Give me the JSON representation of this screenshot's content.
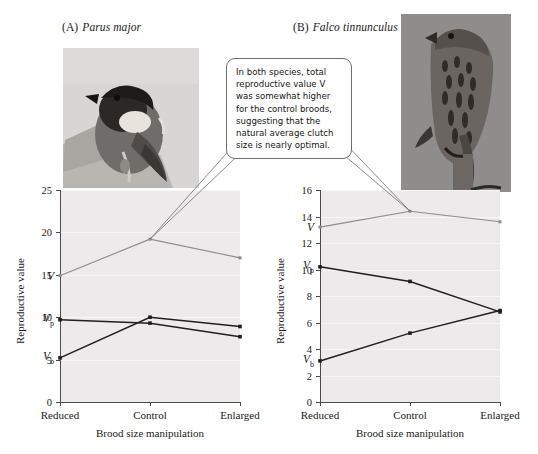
{
  "figure": {
    "callout_text": "In both species, total reproductive value V was somewhat higher for the control broods, suggesting that the natural average clutch size is nearly optimal."
  },
  "panels": [
    {
      "tag": "(A)",
      "species": "Parus major",
      "photo_name": "great-tit-photograph",
      "photo_caption": "Great tit perched on a branch"
    },
    {
      "tag": "(B)",
      "species": "Falco tinnunculus",
      "photo_name": "common-kestrel-photograph",
      "photo_caption": "Common kestrel perched on a post"
    }
  ],
  "chart_data": [
    {
      "type": "line",
      "title": "Parus major",
      "panel": "(A)",
      "xlabel": "Brood size manipulation",
      "ylabel": "Reproductive value",
      "categories": [
        "Reduced",
        "Control",
        "Enlarged"
      ],
      "ylim": [
        0,
        25
      ],
      "yticks": [
        0,
        5,
        10,
        15,
        20,
        25
      ],
      "grid": true,
      "legend": "inline-labels-at-left",
      "series": [
        {
          "name": "V",
          "label": "V",
          "sub": "",
          "values": [
            14.9,
            19.2,
            17.0
          ],
          "color": "#8c8c8c"
        },
        {
          "name": "Vp",
          "label": "V",
          "sub": "p",
          "values": [
            9.7,
            9.3,
            7.7
          ],
          "color": "#1f1f1f"
        },
        {
          "name": "Vb",
          "label": "V",
          "sub": "b",
          "values": [
            5.2,
            10.0,
            8.9
          ],
          "color": "#1f1f1f"
        }
      ]
    },
    {
      "type": "line",
      "title": "Falco tinnunculus",
      "panel": "(B)",
      "xlabel": "Brood size manipulation",
      "ylabel": "Reproductive value",
      "categories": [
        "Reduced",
        "Control",
        "Enlarged"
      ],
      "ylim": [
        0,
        16
      ],
      "yticks": [
        0,
        2,
        4,
        6,
        8,
        10,
        12,
        14,
        16
      ],
      "grid": true,
      "legend": "inline-labels-at-left",
      "series": [
        {
          "name": "V",
          "label": "V",
          "sub": "",
          "values": [
            13.2,
            14.4,
            13.6
          ],
          "color": "#8c8c8c"
        },
        {
          "name": "Vp",
          "label": "V",
          "sub": "p",
          "values": [
            10.2,
            9.1,
            6.8
          ],
          "color": "#1f1f1f"
        },
        {
          "name": "Vb",
          "label": "V",
          "sub": "b",
          "values": [
            3.1,
            5.2,
            6.9
          ],
          "color": "#1f1f1f"
        }
      ]
    }
  ]
}
